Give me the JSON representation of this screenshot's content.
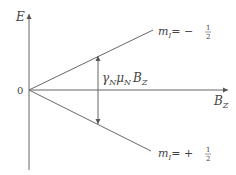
{
  "diagram": {
    "type": "zeeman-splitting-energy-diagram",
    "axes": {
      "y_label": "E",
      "x_label_main": "B",
      "x_label_sub": "Z",
      "origin_label": "0"
    },
    "lines": [
      {
        "label_main": "m",
        "label_sub": "I",
        "label_value": "= −",
        "fraction_num": "1",
        "fraction_den": "2",
        "direction": "up"
      },
      {
        "label_main": "m",
        "label_sub": "I",
        "label_value": "= +",
        "fraction_num": "1",
        "fraction_den": "2",
        "direction": "down"
      }
    ],
    "splitting": {
      "gamma": "γ",
      "gamma_sub": "N",
      "mu": "μ",
      "mu_sub": "N",
      "b": "B",
      "b_sub": "Z"
    },
    "colors": {
      "line": "#555555",
      "text": "#444444",
      "background": "#ffffff"
    }
  }
}
